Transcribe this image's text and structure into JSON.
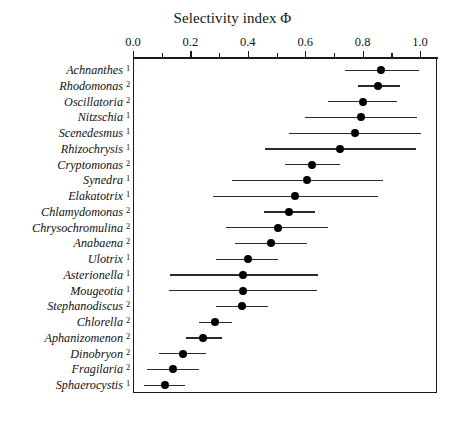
{
  "chart_data": {
    "type": "scatter",
    "title": "Selectivity index Φ",
    "xlabel": "Selectivity index Φ",
    "ylabel": "",
    "xlim": [
      0.0,
      1.06
    ],
    "grid": false,
    "legend": null,
    "orientation": "horizontal",
    "marker": "filled-circle",
    "error_representation": "horizontal range bar",
    "tick_labels": [
      "0.0",
      "0.2",
      "0.4",
      "0.6",
      "0.8",
      "1.0"
    ],
    "tick_values": [
      0.0,
      0.2,
      0.4,
      0.6,
      0.8,
      1.0
    ],
    "minor_tick_values": [
      0.1,
      0.3,
      0.5,
      0.7,
      0.9
    ],
    "categories": [
      "Achnanthes",
      "Rhodomonas",
      "Oscillatoria",
      "Nitzschia",
      "Scenedesmus",
      "Rhizochrysis",
      "Cryptomonas",
      "Synedra",
      "Elakatotrix",
      "Chlamydomonas",
      "Chrysochromulina",
      "Anabaena",
      "Ulotrix",
      "Asterionella",
      "Mougeotia",
      "Stephanodiscus",
      "Chlorella",
      "Aphanizomenon",
      "Dinobryon",
      "Fragilaria",
      "Sphaerocystis"
    ],
    "points": [
      {
        "name": "Achnanthes",
        "group": "1",
        "value": 0.865,
        "low": 0.74,
        "high": 0.995
      },
      {
        "name": "Rhodomonas",
        "group": "2",
        "value": 0.855,
        "low": 0.785,
        "high": 0.93
      },
      {
        "name": "Oscillatoria",
        "group": "2",
        "value": 0.8,
        "low": 0.68,
        "high": 0.92
      },
      {
        "name": "Nitzschia",
        "group": "1",
        "value": 0.795,
        "low": 0.6,
        "high": 0.99
      },
      {
        "name": "Scenedesmus",
        "group": "1",
        "value": 0.775,
        "low": 0.545,
        "high": 1.005
      },
      {
        "name": "Rhizochrysis",
        "group": "1",
        "value": 0.72,
        "low": 0.46,
        "high": 0.985
      },
      {
        "name": "Cryptomonas",
        "group": "2",
        "value": 0.625,
        "low": 0.53,
        "high": 0.72
      },
      {
        "name": "Synedra",
        "group": "1",
        "value": 0.605,
        "low": 0.345,
        "high": 0.87
      },
      {
        "name": "Elakatotrix",
        "group": "1",
        "value": 0.565,
        "low": 0.28,
        "high": 0.855
      },
      {
        "name": "Chlamydomonas",
        "group": "2",
        "value": 0.545,
        "low": 0.455,
        "high": 0.635
      },
      {
        "name": "Chrysochromulina",
        "group": "2",
        "value": 0.505,
        "low": 0.325,
        "high": 0.68
      },
      {
        "name": "Anabaena",
        "group": "2",
        "value": 0.48,
        "low": 0.355,
        "high": 0.605
      },
      {
        "name": "Ulotrix",
        "group": "1",
        "value": 0.4,
        "low": 0.29,
        "high": 0.505
      },
      {
        "name": "Asterionella",
        "group": "1",
        "value": 0.385,
        "low": 0.13,
        "high": 0.645
      },
      {
        "name": "Mougeotia",
        "group": "1",
        "value": 0.385,
        "low": 0.125,
        "high": 0.64
      },
      {
        "name": "Stephanodiscus",
        "group": "2",
        "value": 0.38,
        "low": 0.29,
        "high": 0.47
      },
      {
        "name": "Chlorella",
        "group": "2",
        "value": 0.285,
        "low": 0.23,
        "high": 0.345
      },
      {
        "name": "Aphanizomenon",
        "group": "2",
        "value": 0.245,
        "low": 0.185,
        "high": 0.31
      },
      {
        "name": "Dinobryon",
        "group": "2",
        "value": 0.175,
        "low": 0.09,
        "high": 0.255
      },
      {
        "name": "Fragilaria",
        "group": "2",
        "value": 0.14,
        "low": 0.05,
        "high": 0.23
      },
      {
        "name": "Sphaerocystis",
        "group": "1",
        "value": 0.11,
        "low": 0.04,
        "high": 0.18
      }
    ]
  },
  "colors": {
    "axis": "#1a1a1a",
    "marker": "#000000",
    "errorbar": "#2a2a2a",
    "background": "#ffffff",
    "text": "#121212"
  }
}
